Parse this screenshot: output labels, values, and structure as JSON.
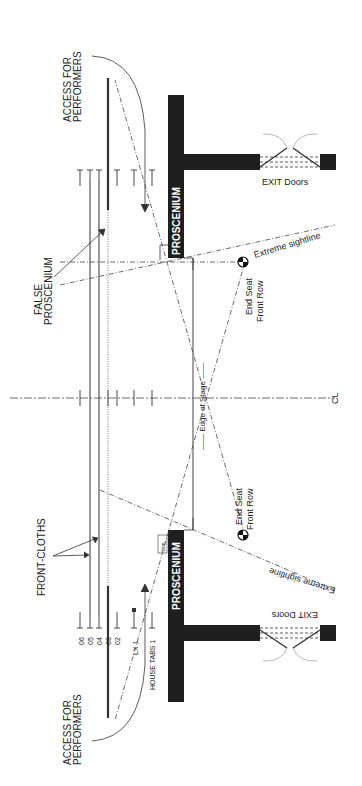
{
  "diagram": {
    "type": "theatre stage ground plan (rotated 90 degrees)",
    "labels": {
      "access_top_1": "ACCESS FOR",
      "access_top_2": "PERFORMERS",
      "access_bottom_1": "ACCESS FOR",
      "access_bottom_2": "PERFORMERS",
      "false_proscenium_1": "FALSE",
      "false_proscenium_2": "PROSCENIUM",
      "front_cloths": "FRONT-CLOTHS",
      "proscenium_top": "PROSCENIUM",
      "proscenium_bottom": "PROSCENIUM",
      "exit_doors_top": "EXIT Doors",
      "exit_doors_bottom": "EXIT Doors",
      "edge_of_stage": "—— Edge of Stage ——",
      "centerline": "CL",
      "end_seat_top_1": "End Seat",
      "end_seat_top_2": "Front Row",
      "end_seat_bottom_1": "End Seat",
      "end_seat_bottom_2": "Front Row",
      "sightline_top": "Extreme sightline",
      "sightline_bottom": "Extreme sightline",
      "iron": "Iron",
      "house_tabs": "HOUSE TABS 1",
      "lx1": "LX 1"
    },
    "bar_numbers": [
      "06",
      "05",
      "04",
      "03",
      "02"
    ],
    "colors": {
      "wall": "#1f1f1f",
      "line": "#333333",
      "background": "#ffffff"
    }
  }
}
